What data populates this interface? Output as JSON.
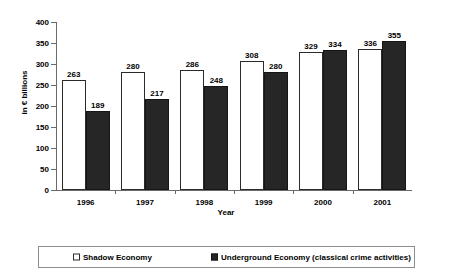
{
  "chart_data": {
    "type": "bar",
    "title": "",
    "subtitle": "",
    "xlabel": "Year",
    "ylabel": "in € billions",
    "categories": [
      "1996",
      "1997",
      "1998",
      "1999",
      "2000",
      "2001"
    ],
    "series": [
      {
        "name": "Shadow Economy",
        "values": [
          263,
          280,
          286,
          308,
          329,
          336
        ],
        "color": "#ffffff",
        "edge_color": "#2b2b2b"
      },
      {
        "name": "Underground Economy (classical crime activities)",
        "values": [
          189,
          217,
          248,
          280,
          334,
          355
        ],
        "color": "#262626",
        "edge_color": "#151515"
      }
    ],
    "ylim": [
      0,
      400
    ],
    "yticks": [
      0,
      50,
      100,
      150,
      200,
      250,
      300,
      350,
      400
    ],
    "ytick_labels": [
      "0",
      "50",
      "100",
      "150",
      "200",
      "250",
      "300",
      "350",
      "400"
    ],
    "grid": false,
    "data_labels": true,
    "legend_position": "bottom"
  },
  "legend": {
    "entries": [
      {
        "label": "Shadow Economy",
        "marker": "open-square-marker"
      },
      {
        "label": "Underground Economy (classical crime activities)",
        "marker": "filled-square-marker"
      }
    ]
  }
}
